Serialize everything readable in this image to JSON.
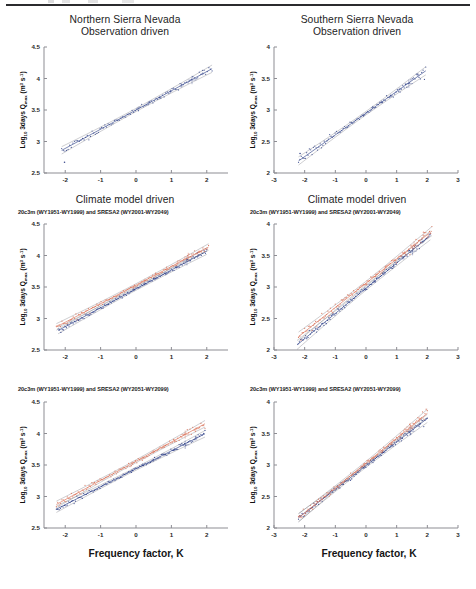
{
  "figure": {
    "page_rule": "horizontal-rule",
    "x_axis_label": "Frequency factor, K",
    "y_axis_label_main": "Log",
    "y_axis_label_sub": "10",
    "y_axis_label_mid": " 3days Q",
    "y_axis_label_sub2": "max",
    "y_axis_label_units": " (m",
    "y_axis_label_sup": "3",
    "y_axis_label_units2": " s",
    "y_axis_label_sup2": "-1",
    "y_axis_label_close": ")"
  },
  "columns": [
    {
      "id": "north",
      "title_line1": "Northern Sierra Nevada",
      "title_line2": "Observation driven"
    },
    {
      "id": "south",
      "title_line1": "Southern Sierra Nevada",
      "title_line2": "Observation driven"
    }
  ],
  "row2_title": "Climate model driven",
  "subtitles": {
    "row2": "20c3m (WY1951-WY1999) and SRESA2 (WY2001-WY2049)",
    "row3": "20c3m (WY1951-WY1999) and SRESA2 (WY2051-WY2099)"
  },
  "colors": {
    "series_historical": "#2d3f87",
    "series_future": "#d9735a",
    "series_obs": "#3a4a8c",
    "fit_line": "#7d7d85",
    "axis": "#8d8d93",
    "text": "#1a1a1a"
  },
  "chart_data": [
    {
      "id": "panel-north-obs",
      "type": "scatter",
      "title": "Northern Sierra Nevada / Observation driven",
      "xlabel": "Frequency factor, K",
      "ylabel": "Log10 3days Qmax (m3 s-1)",
      "xlim": [
        -2.6,
        2.6
      ],
      "ylim": [
        2.5,
        4.5
      ],
      "xticks": [
        -2,
        -1,
        0,
        1,
        2
      ],
      "yticks": [
        2.5,
        3,
        3.5,
        4,
        4.5
      ],
      "grid": false,
      "legend": "none",
      "series": [
        {
          "name": "Observation",
          "color": "#3a4a8c",
          "fit_slope": 0.305,
          "fit_intercept": 3.5,
          "x_range": [
            -2.1,
            2.15
          ],
          "n_points": 95,
          "scatter_sd": 0.018,
          "outliers": [
            [
              -2.02,
              2.67
            ]
          ]
        }
      ],
      "confidence_bands": [
        {
          "name": "95% CI",
          "color": "#7d7d85",
          "offset": 0.045
        }
      ]
    },
    {
      "id": "panel-south-obs",
      "type": "scatter",
      "title": "Southern Sierra Nevada / Observation driven",
      "xlabel": "Frequency factor, K",
      "ylabel": "Log10 3days Qmax (m3 s-1)",
      "xlim": [
        -3,
        3
      ],
      "ylim": [
        2,
        4
      ],
      "xticks": [
        -3,
        -2,
        -1,
        0,
        1,
        2,
        3
      ],
      "yticks": [
        2,
        2.5,
        3,
        3.5,
        4
      ],
      "grid": false,
      "legend": "none",
      "series": [
        {
          "name": "Observation",
          "color": "#3a4a8c",
          "fit_slope": 0.345,
          "fit_intercept": 2.95,
          "x_range": [
            -2.2,
            1.95
          ],
          "n_points": 95,
          "scatter_sd": 0.02,
          "outliers": [
            [
              -2.15,
              2.31
            ]
          ]
        }
      ],
      "confidence_bands": [
        {
          "name": "95% CI",
          "color": "#7d7d85",
          "offset": 0.05
        }
      ]
    },
    {
      "id": "panel-north-2001-2049",
      "type": "scatter",
      "title": "20c3m (WY1951-WY1999) and SRESA2 (WY2001-WY2049)",
      "xlabel": "Frequency factor, K",
      "ylabel": "Log10 3days Qmax (m3 s-1)",
      "xlim": [
        -2.6,
        2.6
      ],
      "ylim": [
        2.5,
        4.5
      ],
      "xticks": [
        -2,
        -1,
        0,
        1,
        2
      ],
      "yticks": [
        2.5,
        3,
        3.5,
        4,
        4.5
      ],
      "grid": false,
      "legend": "none",
      "series": [
        {
          "name": "20c3m (WY1951-WY1999)",
          "color": "#2d3f87",
          "fit_slope": 0.3,
          "fit_intercept": 3.47,
          "x_range": [
            -2.2,
            2.0
          ],
          "n_points": 110,
          "scatter_sd": 0.012
        },
        {
          "name": "SRESA2 (WY2001-WY2049)",
          "color": "#d9735a",
          "fit_slope": 0.295,
          "fit_intercept": 3.53,
          "x_range": [
            -2.25,
            2.05
          ],
          "n_points": 110,
          "scatter_sd": 0.013
        }
      ],
      "confidence_bands": [
        {
          "name": "95% CI",
          "color": "#7d7d85",
          "offset": 0.04
        }
      ]
    },
    {
      "id": "panel-south-2001-2049",
      "type": "scatter",
      "title": "20c3m (WY1951-WY1999) and SRESA2 (WY2001-WY2049)",
      "xlabel": "Frequency factor, K",
      "ylabel": "Log10 3days Qmax (m3 s-1)",
      "xlim": [
        -3,
        3
      ],
      "ylim": [
        2,
        4
      ],
      "xticks": [
        -3,
        -2,
        -1,
        0,
        1,
        2,
        3
      ],
      "yticks": [
        2,
        2.5,
        3,
        3.5,
        4
      ],
      "grid": false,
      "legend": "none",
      "series": [
        {
          "name": "20c3m (WY1951-WY1999)",
          "color": "#2d3f87",
          "fit_slope": 0.4,
          "fit_intercept": 2.98,
          "x_range": [
            -2.25,
            2.1
          ],
          "n_points": 110,
          "scatter_sd": 0.018
        },
        {
          "name": "SRESA2 (WY2001-WY2049)",
          "color": "#d9735a",
          "fit_slope": 0.385,
          "fit_intercept": 3.06,
          "x_range": [
            -2.2,
            2.15
          ],
          "n_points": 110,
          "scatter_sd": 0.02
        }
      ],
      "confidence_bands": [
        {
          "name": "95% CI",
          "color": "#7d7d85",
          "offset": 0.055
        }
      ]
    },
    {
      "id": "panel-north-2051-2099",
      "type": "scatter",
      "title": "20c3m (WY1951-WY1999) and SRESA2 (WY2051-WY2099)",
      "xlabel": "Frequency factor, K",
      "ylabel": "Log10 3days Qmax (m3 s-1)",
      "xlim": [
        -2.6,
        2.6
      ],
      "ylim": [
        2.5,
        4.5
      ],
      "xticks": [
        -2,
        -1,
        0,
        1,
        2
      ],
      "yticks": [
        2.5,
        3,
        3.5,
        4,
        4.5
      ],
      "grid": false,
      "legend": "none",
      "series": [
        {
          "name": "20c3m (WY1951-WY1999)",
          "color": "#2d3f87",
          "fit_slope": 0.285,
          "fit_intercept": 3.44,
          "x_range": [
            -2.25,
            1.95
          ],
          "n_points": 110,
          "scatter_sd": 0.012
        },
        {
          "name": "SRESA2 (WY2051-WY2099)",
          "color": "#d9735a",
          "fit_slope": 0.305,
          "fit_intercept": 3.56,
          "x_range": [
            -2.25,
            1.95
          ],
          "n_points": 110,
          "scatter_sd": 0.014
        }
      ],
      "confidence_bands": [
        {
          "name": "95% CI",
          "color": "#7d7d85",
          "offset": 0.04
        }
      ]
    },
    {
      "id": "panel-south-2051-2099",
      "type": "scatter",
      "title": "20c3m (WY1951-WY1999) and SRESA2 (WY2051-WY2099)",
      "xlabel": "Frequency factor, K",
      "ylabel": "Log10 3days Qmax (m3 s-1)",
      "xlim": [
        -3,
        3
      ],
      "ylim": [
        2,
        4
      ],
      "xticks": [
        -3,
        -2,
        -1,
        0,
        1,
        2,
        3
      ],
      "yticks": [
        2,
        2.5,
        3,
        3.5,
        4
      ],
      "grid": false,
      "legend": "none",
      "series": [
        {
          "name": "20c3m (WY1951-WY1999)",
          "color": "#2d3f87",
          "fit_slope": 0.375,
          "fit_intercept": 2.99,
          "x_range": [
            -2.2,
            2.0
          ],
          "n_points": 110,
          "scatter_sd": 0.017
        },
        {
          "name": "SRESA2 (WY2051-WY2099)",
          "color": "#d9735a",
          "fit_slope": 0.395,
          "fit_intercept": 3.03,
          "x_range": [
            -2.2,
            2.0
          ],
          "n_points": 110,
          "scatter_sd": 0.019
        }
      ],
      "confidence_bands": [
        {
          "name": "95% CI",
          "color": "#7d7d85",
          "offset": 0.05
        }
      ]
    }
  ]
}
